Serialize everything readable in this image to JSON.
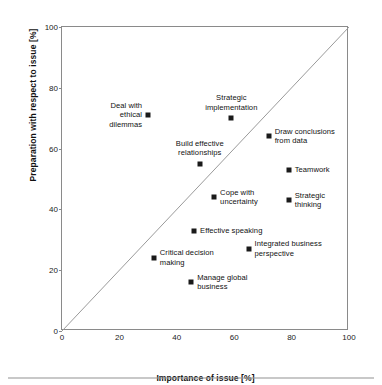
{
  "chart_data": {
    "type": "scatter",
    "title": "",
    "xlabel": "Importance of issue [%]",
    "ylabel": "Preparation with respect to issue [%]",
    "xlim": [
      0,
      100
    ],
    "ylim": [
      0,
      100
    ],
    "xticks": [
      0,
      20,
      40,
      60,
      80,
      100
    ],
    "yticks": [
      0,
      20,
      40,
      60,
      80,
      100
    ],
    "grid": false,
    "legend": "none",
    "annotations": [
      {
        "label": "Deal with\nethical\ndilemmas",
        "x": 30,
        "y": 71,
        "label_side": "left"
      },
      {
        "label": "Strategic\nimplementation",
        "x": 59,
        "y": 70,
        "label_side": "above"
      },
      {
        "label": "Draw conclusions\nfrom data",
        "x": 72,
        "y": 64,
        "label_side": "right"
      },
      {
        "label": "Build effective\nrelationships",
        "x": 48,
        "y": 55,
        "label_side": "above"
      },
      {
        "label": "Teamwork",
        "x": 79,
        "y": 53,
        "label_side": "right"
      },
      {
        "label": "Cope with\nuncertainty",
        "x": 53,
        "y": 44,
        "label_side": "right"
      },
      {
        "label": "Strategic\nthinking",
        "x": 79,
        "y": 43,
        "label_side": "right"
      },
      {
        "label": "Effective speaking",
        "x": 46,
        "y": 33,
        "label_side": "right"
      },
      {
        "label": "Integrated business\nperspective",
        "x": 65,
        "y": 27,
        "label_side": "right"
      },
      {
        "label": "Critical decision\nmaking",
        "x": 32,
        "y": 24,
        "label_side": "right"
      },
      {
        "label": "Manage global\nbusiness",
        "x": 45,
        "y": 16,
        "label_side": "right"
      }
    ],
    "reference_line": {
      "type": "identity",
      "from": [
        0,
        0
      ],
      "to": [
        100,
        100
      ]
    },
    "marker_color": "#1a1a1a",
    "frame_color": "#8a8a8a"
  }
}
